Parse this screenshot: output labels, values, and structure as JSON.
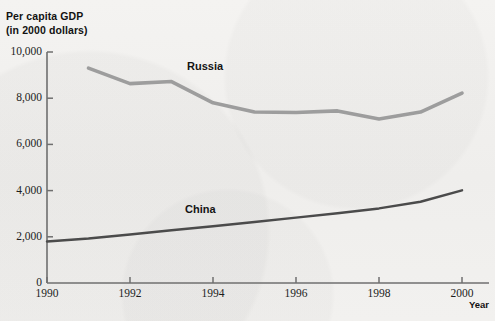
{
  "axis_title": {
    "line1": "Per capita GDP",
    "line2": "(in 2000 dollars)"
  },
  "x_axis_name": "Year",
  "colors": {
    "background": "#f2f1ef",
    "axis": "#6f6f6f",
    "russia_line": "#9d9d9d",
    "china_line": "#4b4b4b",
    "text": "#1d1d1d"
  },
  "y_ticks": [
    {
      "label": "10,000",
      "value": 10000
    },
    {
      "label": "8,000",
      "value": 8000
    },
    {
      "label": "6,000",
      "value": 6000
    },
    {
      "label": "4,000",
      "value": 4000
    },
    {
      "label": "2,000",
      "value": 2000
    },
    {
      "label": "0",
      "value": 0
    }
  ],
  "x_ticks": [
    {
      "label": "1990",
      "value": 1990
    },
    {
      "label": "1992",
      "value": 1992
    },
    {
      "label": "1994",
      "value": 1994
    },
    {
      "label": "1996",
      "value": 1996
    },
    {
      "label": "1998",
      "value": 1998
    },
    {
      "label": "2000",
      "value": 2000
    }
  ],
  "chart_data": {
    "type": "line",
    "title": "Per capita GDP (in 2000 dollars)",
    "xlabel": "Year",
    "ylabel": "Per capita GDP (in 2000 dollars)",
    "xlim": [
      1990,
      2000
    ],
    "ylim": [
      0,
      10000
    ],
    "ytick_values": [
      0,
      2000,
      4000,
      6000,
      8000,
      10000
    ],
    "xtick_values": [
      1990,
      1992,
      1994,
      1996,
      1998,
      2000
    ],
    "grid": false,
    "legend": "inline-series-labels",
    "series": [
      {
        "name": "Russia",
        "color": "#9d9d9d",
        "x": [
          1991,
          1992,
          1993,
          1994,
          1995,
          1996,
          1997,
          1998,
          1999,
          2000
        ],
        "values": [
          9300,
          8630,
          8720,
          7800,
          7400,
          7380,
          7450,
          7100,
          7400,
          8220
        ]
      },
      {
        "name": "China",
        "color": "#4b4b4b",
        "x": [
          1990,
          1991,
          1992,
          1993,
          1994,
          1995,
          1996,
          1997,
          1998,
          1999,
          2000
        ],
        "values": [
          1800,
          1930,
          2100,
          2280,
          2460,
          2640,
          2830,
          3020,
          3230,
          3520,
          4010
        ]
      }
    ]
  }
}
